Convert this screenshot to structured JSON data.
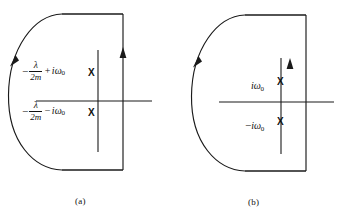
{
  "figure": {
    "kind": "contour-integration-diagram",
    "panels": [
      {
        "id": "a",
        "caption": "(a)",
        "contour_description": "closed semicircular contour in the left half of the complex plane",
        "arc_arrow_direction": "clockwise-downward",
        "vertical_arrow_direction": "upward",
        "poles": [
          {
            "marker": "X",
            "label_lead_minus": "−",
            "numerator": "λ",
            "denominator": "2m",
            "operator": "+",
            "imaginary_unit": "i",
            "omega": "ω",
            "omega_subscript": "0"
          },
          {
            "marker": "X",
            "label_lead_minus": "−",
            "numerator": "λ",
            "denominator": "2m",
            "operator": "−",
            "imaginary_unit": "i",
            "omega": "ω",
            "omega_subscript": "0"
          }
        ]
      },
      {
        "id": "b",
        "caption": "(b)",
        "contour_description": "closed semicircular contour in the left half of the complex plane",
        "arc_arrow_direction": "clockwise-downward",
        "vertical_arrow_direction": "upward",
        "poles": [
          {
            "marker": "X",
            "label_sign": "",
            "imaginary_unit": "i",
            "omega": "ω",
            "omega_subscript": "0",
            "label_text": "iω₀"
          },
          {
            "marker": "X",
            "label_sign": "−",
            "imaginary_unit": "i",
            "omega": "ω",
            "omega_subscript": "0",
            "label_text": "−iω₀"
          }
        ]
      }
    ],
    "colors": {
      "ink": "#1a1a1a",
      "text": "#111111",
      "background": "#ffffff"
    }
  }
}
